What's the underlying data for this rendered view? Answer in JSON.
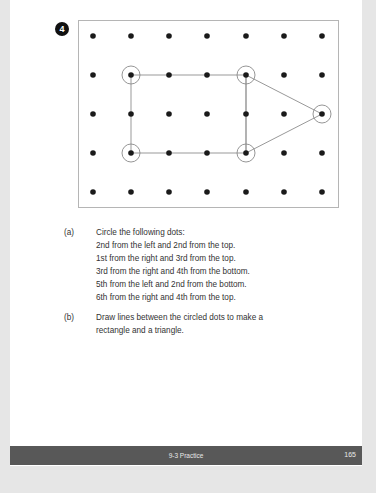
{
  "problem": {
    "number": "4"
  },
  "grid": {
    "columns": 7,
    "rows": 5,
    "col_x": [
      93,
      131,
      169,
      207,
      246,
      284,
      322
    ],
    "row_y": [
      36,
      75,
      114,
      153,
      192
    ],
    "circled_dots": [
      {
        "label": "2nd from left, 2nd from top",
        "col": 1,
        "row": 1
      },
      {
        "label": "1st from right, 3rd from top",
        "col": 6,
        "row": 2
      },
      {
        "label": "3rd from right, 4th from bottom",
        "col": 4,
        "row": 1
      },
      {
        "label": "5th from left, 2nd from bottom",
        "col": 4,
        "row": 3
      },
      {
        "label": "6th from right, 4th from top",
        "col": 1,
        "row": 3
      }
    ],
    "rectangle": [
      [
        1,
        1
      ],
      [
        4,
        1
      ],
      [
        4,
        3
      ],
      [
        1,
        3
      ]
    ],
    "triangle": [
      [
        4,
        1
      ],
      [
        6,
        2
      ],
      [
        4,
        3
      ]
    ],
    "colors": {
      "dot": "#1a1a1a",
      "line": "#999999",
      "circle": "#8a8a8a",
      "border": "#b5b5b5"
    }
  },
  "questions": [
    {
      "marker": "(a)",
      "lines": [
        "Circle the following dots:",
        "2nd from the left and 2nd from the top.",
        "1st from the right and 3rd from the top.",
        "3rd from the right and 4th from the bottom.",
        "5th from the left and 2nd from the bottom.",
        "6th from the right and 4th from the top."
      ]
    },
    {
      "marker": "(b)",
      "lines": [
        "Draw lines between the circled dots to make a",
        "rectangle and a triangle."
      ]
    }
  ],
  "footer": {
    "section": "9-3 Practice",
    "page_number": "165",
    "background": "#585858"
  }
}
